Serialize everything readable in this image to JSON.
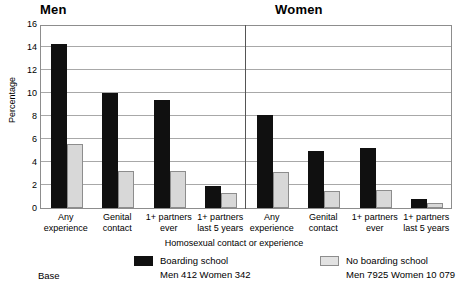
{
  "panels": {
    "men_title": "Men",
    "women_title": "Women"
  },
  "axis": {
    "ylabel": "Percentage",
    "xlabel": "Homosexual contact or experience",
    "yticks": [
      "16",
      "14",
      "12",
      "10",
      "8",
      "6",
      "4",
      "2",
      "0"
    ],
    "ymin": 0,
    "ymax": 16,
    "ystep": 2
  },
  "legend": {
    "base_label": "Base",
    "boarding": {
      "label": "Boarding school",
      "base": "Men 412  Women 342",
      "color": "#101010"
    },
    "no_boarding": {
      "label": "No boarding school",
      "base": "Men 7925  Women 10 079",
      "color": "#e2e2e2"
    }
  },
  "chart_data": {
    "type": "bar",
    "title": "",
    "xlabel": "Homosexual contact or experience",
    "ylabel": "Percentage",
    "ylim": [
      0,
      16
    ],
    "ytick_values": [
      0,
      2,
      4,
      6,
      8,
      10,
      12,
      14,
      16
    ],
    "grid": true,
    "legend_position": "bottom",
    "panels": [
      {
        "name": "Men",
        "categories": [
          "Any experience",
          "Genital contact",
          "1+ partners ever",
          "1+ partners last 5 years"
        ],
        "series": [
          {
            "name": "Boarding school",
            "values": [
              14.3,
              10.0,
              9.4,
              1.9
            ]
          },
          {
            "name": "No boarding school",
            "values": [
              5.6,
              3.2,
              3.2,
              1.3
            ]
          }
        ]
      },
      {
        "name": "Women",
        "categories": [
          "Any experience",
          "Genital contact",
          "1+ partners ever",
          "1+ partners last 5 years"
        ],
        "series": [
          {
            "name": "Boarding school",
            "values": [
              8.1,
              5.0,
              5.2,
              0.8
            ]
          },
          {
            "name": "No boarding school",
            "values": [
              3.1,
              1.5,
              1.6,
              0.45
            ]
          }
        ]
      }
    ]
  },
  "category_labels": [
    "Any\nexperience",
    "Genital\ncontact",
    "1+ partners\never",
    "1+ partners\nlast 5 years"
  ]
}
